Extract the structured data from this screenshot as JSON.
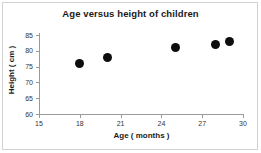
{
  "chart_data": {
    "type": "scatter",
    "title": "Age versus height of children",
    "xlabel": "Age ( months )",
    "ylabel": "Height ( cm )",
    "xlim": [
      15,
      30
    ],
    "ylim": [
      60,
      85
    ],
    "xticks": [
      15,
      18,
      21,
      24,
      27,
      30
    ],
    "yticks": [
      60,
      65,
      70,
      75,
      80,
      85
    ],
    "grid": false,
    "legend": false,
    "marker": "filled-circle",
    "marker_color": "#0d0d0d",
    "points": [
      {
        "x": 18,
        "y": 76
      },
      {
        "x": 20,
        "y": 78
      },
      {
        "x": 25,
        "y": 81
      },
      {
        "x": 28,
        "y": 82
      },
      {
        "x": 29,
        "y": 83
      }
    ]
  },
  "frame": {
    "border_color": "#d2d2d2",
    "background": "#ffffff"
  }
}
